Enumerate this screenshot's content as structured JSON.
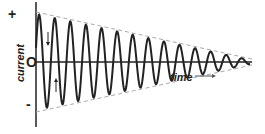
{
  "diagram": {
    "title": "",
    "y_axis_label": "current",
    "x_axis_label": "time",
    "tick_plus": "+",
    "tick_zero": "O",
    "tick_minus": "-",
    "cycles_visible": 14,
    "colors": {
      "curve": "#222222",
      "envelope": "#aaaaaa",
      "axis": "#222222"
    }
  }
}
